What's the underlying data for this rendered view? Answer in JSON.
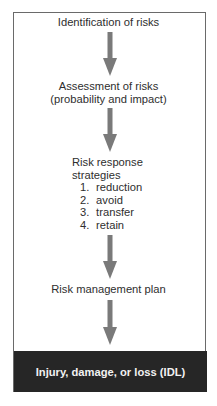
{
  "diagram": {
    "type": "flowchart",
    "direction": "top-to-bottom",
    "colors": {
      "arrow": "#7a7a7a",
      "frame_border": "#6a6a6a",
      "outcome_background": "#262626",
      "outcome_text": "#f2f2f2",
      "text": "#2e2e2e"
    },
    "steps": [
      {
        "label": "Identification of risks"
      },
      {
        "label_line1": "Assessment of risks",
        "label_line2": "(probability and impact)"
      },
      {
        "title_line1": "Risk response",
        "title_line2": "strategies",
        "items": [
          {
            "num": "1.",
            "label": "reduction"
          },
          {
            "num": "2.",
            "label": "avoid"
          },
          {
            "num": "3.",
            "label": "transfer"
          },
          {
            "num": "4.",
            "label": "retain"
          }
        ]
      },
      {
        "label": "Risk management plan"
      }
    ],
    "outcome": {
      "label": "Injury, damage, or loss (IDL)"
    },
    "arrows": [
      {
        "icon": "down-arrow-icon",
        "from": "Identification of risks",
        "to": "Assessment of risks"
      },
      {
        "icon": "down-arrow-icon",
        "from": "Assessment of risks",
        "to": "Risk response strategies"
      },
      {
        "icon": "down-arrow-icon",
        "from": "Risk response strategies",
        "to": "Risk management plan"
      },
      {
        "icon": "down-arrow-icon",
        "from": "Risk management plan",
        "to": "Injury, damage, or loss (IDL)"
      }
    ]
  }
}
